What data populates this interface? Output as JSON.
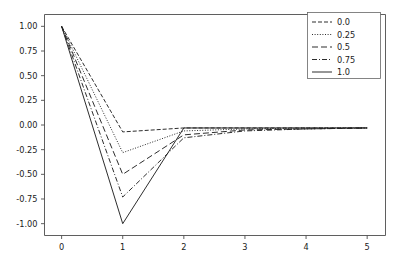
{
  "figure": {
    "background_color": "#ffffff",
    "line_color": "#222222",
    "axis_color": "#4d4d4d",
    "legend_border_color": "#666666"
  },
  "chart_data": {
    "type": "line",
    "title": "",
    "xlabel": "",
    "ylabel": "",
    "xlim": [
      -0.28,
      5.3
    ],
    "ylim": [
      -1.12,
      1.12
    ],
    "grid": false,
    "legend_position": "upper right",
    "xticks": [
      "0",
      "1",
      "2",
      "3",
      "4",
      "5"
    ],
    "xtick_values": [
      0,
      1,
      2,
      3,
      4,
      5
    ],
    "yticks": [
      "1.00",
      "0.75",
      "0.50",
      "0.25",
      "0.00",
      "-0.25",
      "-0.50",
      "-0.75",
      "-1.00"
    ],
    "ytick_values": [
      1.0,
      0.75,
      0.5,
      0.25,
      0.0,
      -0.25,
      -0.5,
      -0.75,
      -1.0
    ],
    "x": [
      0,
      1,
      2,
      3,
      4,
      5
    ],
    "series": [
      {
        "name": "0.0",
        "linestyle": "dashed",
        "dasharray": "4,2",
        "values": [
          1.0,
          -0.07,
          -0.03,
          -0.03,
          -0.03,
          -0.03
        ]
      },
      {
        "name": "0.25",
        "linestyle": "dotted",
        "dasharray": "1,1.6",
        "values": [
          1.0,
          -0.28,
          -0.06,
          -0.04,
          -0.03,
          -0.03
        ]
      },
      {
        "name": "0.5",
        "linestyle": "long-dash",
        "dasharray": "6,3",
        "values": [
          1.0,
          -0.5,
          -0.1,
          -0.05,
          -0.04,
          -0.03
        ]
      },
      {
        "name": "0.75",
        "linestyle": "dash-dot",
        "dasharray": "5,2,1,2",
        "values": [
          1.0,
          -0.73,
          -0.13,
          -0.06,
          -0.04,
          -0.03
        ]
      },
      {
        "name": "1.0",
        "linestyle": "solid",
        "dasharray": "",
        "values": [
          1.0,
          -1.0,
          -0.03,
          -0.03,
          -0.03,
          -0.03
        ]
      }
    ]
  }
}
